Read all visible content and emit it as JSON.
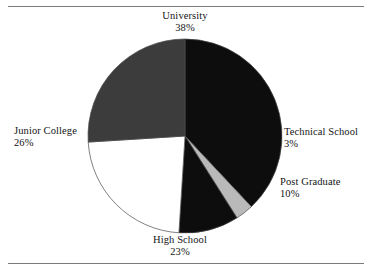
{
  "figure": {
    "background_color": "#ffffff",
    "rule_color": "#7a7a7a",
    "has_top_rule": true,
    "has_bottom_rule": true
  },
  "chart_data": {
    "type": "pie",
    "title": "",
    "subtitle": "",
    "xlabel": "",
    "ylabel": "",
    "grid": false,
    "legend_position": "none",
    "label_style": "outside-callout",
    "start_angle_deg": 0,
    "direction": "clockwise",
    "center": {
      "x": 185,
      "y": 136
    },
    "radius": 97,
    "total_percent": 100,
    "categories": [
      "University",
      "Technical School",
      "Post Graduate",
      "High School",
      "Junior College"
    ],
    "values": [
      38,
      3,
      10,
      23,
      26
    ],
    "value_labels": [
      "38%",
      "3%",
      "10%",
      "23%",
      "26%"
    ],
    "colors": [
      "#0d0d0d",
      "#b9b9b9",
      "#0d0d0d",
      "#ffffff",
      "#3c3c3c"
    ],
    "slices": [
      {
        "name": "University",
        "value": 38,
        "value_label": "38%",
        "color": "#0d0d0d",
        "start_deg": 0,
        "end_deg": 136.8,
        "label_position": "top"
      },
      {
        "name": "Technical School",
        "value": 3,
        "value_label": "3%",
        "color": "#b9b9b9",
        "start_deg": 136.8,
        "end_deg": 147.6,
        "label_position": "right"
      },
      {
        "name": "Post Graduate",
        "value": 10,
        "value_label": "10%",
        "color": "#0d0d0d",
        "start_deg": 147.6,
        "end_deg": 183.6,
        "label_position": "right-lower"
      },
      {
        "name": "High School",
        "value": 23,
        "value_label": "23%",
        "color": "#ffffff",
        "start_deg": 183.6,
        "end_deg": 266.4,
        "label_position": "bottom"
      },
      {
        "name": "Junior College",
        "value": 26,
        "value_label": "26%",
        "color": "#3c3c3c",
        "start_deg": 266.4,
        "end_deg": 360,
        "label_position": "left"
      }
    ]
  }
}
